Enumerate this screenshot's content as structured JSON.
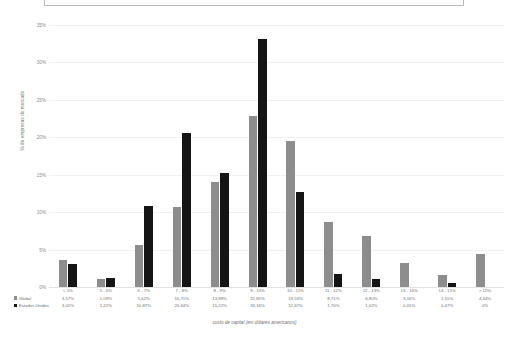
{
  "top_panel": {
    "present": true
  },
  "chart_data": {
    "type": "bar",
    "title": "",
    "xlabel": "custo de capital (em dólares americanos)",
    "ylabel": "% de empresas do mercado",
    "ylim": [
      0,
      35
    ],
    "ytick_labels": [
      "0%",
      "5%",
      "10%",
      "15%",
      "20%",
      "25%",
      "30%",
      "35%"
    ],
    "ytick_values": [
      0,
      5,
      10,
      15,
      20,
      25,
      30,
      35
    ],
    "grid": true,
    "legend_position": "bottom-left",
    "categories": [
      "< 5%",
      "5 - 6%",
      "6 - 7%",
      "7 - 8%",
      "8 - 9%",
      "9 - 10%",
      "10 - 11%",
      "11 - 12%",
      "12 - 13%",
      "13 - 14%",
      "14 - 15%",
      "> 15%"
    ],
    "series": [
      {
        "name": "Global",
        "color": "#8d8d8d",
        "values": [
          3.57,
          1.09,
          5.62,
          10.71,
          13.98,
          22.85,
          19.53,
          8.71,
          6.8,
          3.16,
          1.55,
          4.44
        ],
        "labels": [
          "3,57%",
          "1,09%",
          "5,62%",
          "10,71%",
          "13,98%",
          "22,85%",
          "19,53%",
          "8,71%",
          "6,80%",
          "3,16%",
          "1,55%",
          "4,44%"
        ]
      },
      {
        "name": "Estados Unidos",
        "color": "#151515",
        "values": [
          3.02,
          1.22,
          10.87,
          20.64,
          15.22,
          33.16,
          12.67,
          1.7,
          1.02,
          0.01,
          0.47,
          0.0
        ],
        "labels": [
          "3,02%",
          "1,22%",
          "10,87%",
          "20,64%",
          "15,22%",
          "33,16%",
          "12,67%",
          "1,70%",
          "1,02%",
          "0,01%",
          "0,47%",
          "0%"
        ]
      }
    ]
  }
}
